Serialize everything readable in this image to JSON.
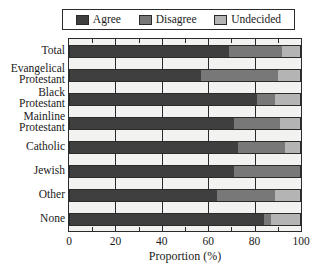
{
  "legend": {
    "position": "top",
    "entries": [
      {
        "label": "Agree",
        "swatch": "agree-swatch",
        "color": "#3f3f3f"
      },
      {
        "label": "Disagree",
        "swatch": "disagree-swatch",
        "color": "#787878"
      },
      {
        "label": "Undecided",
        "swatch": "undecided-swatch",
        "color": "#b4b4b4"
      }
    ]
  },
  "axes": {
    "xlabel": "Proportion (%)",
    "xticks": [
      "0",
      "20",
      "40",
      "60",
      "80",
      "100"
    ],
    "xlim": [
      0,
      100
    ],
    "ylabel": ""
  },
  "chart_data": {
    "type": "bar",
    "orientation": "horizontal",
    "stacked": true,
    "title": "",
    "xlabel": "Proportion (%)",
    "ylabel": "",
    "xlim": [
      0,
      100
    ],
    "xticks": [
      0,
      20,
      40,
      60,
      80,
      100
    ],
    "grid": true,
    "legend_position": "top",
    "categories": [
      "Total",
      "Evangelical Protestant",
      "Black Protestant",
      "Mainline Protestant",
      "Catholic",
      "Jewish",
      "Other",
      "None"
    ],
    "category_labels": [
      [
        "Total"
      ],
      [
        "Evangelical",
        "Protestant"
      ],
      [
        "Black",
        "Protestant"
      ],
      [
        "Mainline",
        "Protestant"
      ],
      [
        "Catholic"
      ],
      [
        "Jewish"
      ],
      [
        "Other"
      ],
      [
        "None"
      ]
    ],
    "series": [
      {
        "name": "Agree",
        "color": "#3f3f3f",
        "values": [
          69,
          57,
          81,
          71,
          73,
          71,
          64,
          84
        ]
      },
      {
        "name": "Disagree",
        "color": "#787878",
        "values": [
          23,
          33,
          8,
          20,
          20,
          29,
          25,
          3
        ]
      },
      {
        "name": "Undecided",
        "color": "#b4b4b4",
        "values": [
          8,
          10,
          11,
          9,
          7,
          0,
          11,
          13
        ]
      }
    ]
  }
}
